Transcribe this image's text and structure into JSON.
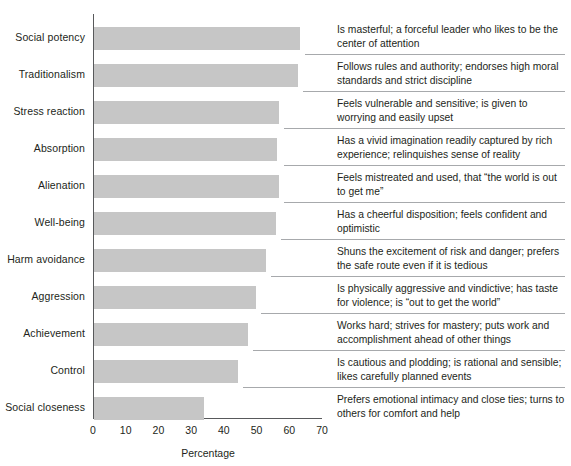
{
  "chart_data": {
    "type": "bar",
    "orientation": "horizontal",
    "title": "",
    "xlabel": "Percentage",
    "ylabel": "",
    "xlim": [
      0,
      70
    ],
    "xticks": [
      0,
      10,
      20,
      30,
      40,
      50,
      60,
      70
    ],
    "grid": false,
    "legend": null,
    "bar_color": "#c6c6c6",
    "axis_color": "#58595b",
    "categories": [
      "Social potency",
      "Traditionalism",
      "Stress reaction",
      "Absorption",
      "Alienation",
      "Well-being",
      "Harm avoidance",
      "Aggression",
      "Achievement",
      "Control",
      "Social closeness"
    ],
    "values": [
      63,
      62.5,
      56.5,
      56,
      56.5,
      55.5,
      52.5,
      49.5,
      47,
      44,
      33.5
    ],
    "annotations": [
      "Is masterful; a forceful leader who likes to be the center of attention",
      "Follows rules and authority; endorses high moral standards and strict discipline",
      "Feels vulnerable and sensitive; is given to worrying and easily upset",
      "Has a vivid imagination readily captured by rich experience; relinquishes sense of reality",
      "Feels mistreated and used, that “the world is out to get me”",
      "Has a cheerful disposition; feels confident and optimistic",
      "Shuns the excitement of risk and danger; prefers the safe route even if it is tedious",
      "Is physically aggressive and vindictive; has taste for violence; is “out to get the world”",
      "Works hard; strives for mastery; puts work and accomplishment ahead of other things",
      "Is cautious and plodding; is rational and sensible; likes carefully planned events",
      "Prefers emotional intimacy and close ties; turns to others for comfort and help"
    ]
  }
}
